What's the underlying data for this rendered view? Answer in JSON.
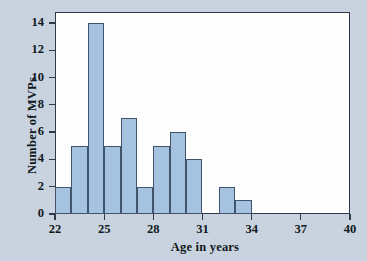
{
  "chart_data": {
    "type": "bar",
    "title": "",
    "xlabel": "Age in years",
    "ylabel": "Number of MVPs",
    "xlim": [
      22,
      40
    ],
    "ylim": [
      0,
      14.8
    ],
    "grid": false,
    "legend": null,
    "bin_width": 1,
    "bins": [
      {
        "x0": 22,
        "x1": 23,
        "value": 2
      },
      {
        "x0": 23,
        "x1": 24,
        "value": 5
      },
      {
        "x0": 24,
        "x1": 25,
        "value": 14
      },
      {
        "x0": 25,
        "x1": 26,
        "value": 5
      },
      {
        "x0": 26,
        "x1": 27,
        "value": 7
      },
      {
        "x0": 27,
        "x1": 28,
        "value": 2
      },
      {
        "x0": 28,
        "x1": 29,
        "value": 5
      },
      {
        "x0": 29,
        "x1": 30,
        "value": 6
      },
      {
        "x0": 30,
        "x1": 31,
        "value": 4
      },
      {
        "x0": 32,
        "x1": 33,
        "value": 2
      },
      {
        "x0": 33,
        "x1": 34,
        "value": 1
      }
    ],
    "values": [
      2,
      5,
      14,
      5,
      7,
      2,
      5,
      6,
      4,
      2,
      1
    ],
    "xticks": [
      22,
      25,
      28,
      31,
      34,
      37,
      40
    ],
    "xtick_labels": [
      "22",
      "25",
      "28",
      "31",
      "34",
      "37",
      "40"
    ],
    "yticks": [
      0,
      2,
      4,
      6,
      8,
      10,
      12,
      14
    ],
    "ytick_labels": [
      "0",
      "2",
      "4",
      "6",
      "8",
      "10",
      "12",
      "14"
    ],
    "colors": {
      "bar_fill": "#a5c3e0",
      "bar_edge": "#41546b",
      "axis": "#2c3a4a",
      "plot_background": "#fdfdfd",
      "figure_background": "#c8d3df",
      "text": "#111820"
    }
  }
}
